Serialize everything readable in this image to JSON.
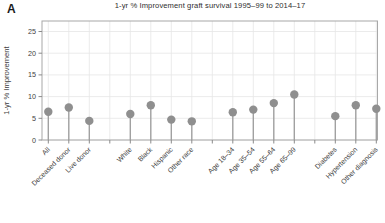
{
  "figure": {
    "panel_label": "A"
  },
  "chart_data": {
    "type": "lollipop",
    "title": "1-yr % Improvement graft survival 1995–99 to 2014–17",
    "xlabel": "",
    "ylabel": "1-yr % Improvement",
    "ylim": [
      0,
      27.4
    ],
    "yticks": [
      0,
      5,
      10,
      15,
      20,
      25
    ],
    "grid": "on",
    "legend": "none",
    "slots_total": 17,
    "series": [
      {
        "label": "All",
        "value": 6.5,
        "slot": 0
      },
      {
        "label": "Deceased donor",
        "value": 7.5,
        "slot": 1
      },
      {
        "label": "Live donor",
        "value": 4.4,
        "slot": 2
      },
      {
        "label": "White",
        "value": 6.0,
        "slot": 4
      },
      {
        "label": "Black",
        "value": 8.0,
        "slot": 5
      },
      {
        "label": "Hispanic",
        "value": 4.7,
        "slot": 6
      },
      {
        "label": "Other race",
        "value": 4.3,
        "slot": 7
      },
      {
        "label": "Age 18–34",
        "value": 6.4,
        "slot": 9
      },
      {
        "label": "Age 35–54",
        "value": 7.0,
        "slot": 10
      },
      {
        "label": "Age 55–64",
        "value": 8.5,
        "slot": 11
      },
      {
        "label": "Age 65–99",
        "value": 10.5,
        "slot": 12
      },
      {
        "label": "Diabetes",
        "value": 5.5,
        "slot": 14
      },
      {
        "label": "Hypertension",
        "value": 8.0,
        "slot": 15
      },
      {
        "label": "Other diagnosis",
        "value": 7.2,
        "slot": 16
      }
    ],
    "groups": [
      {
        "name": "donor",
        "categories": [
          "All",
          "Deceased donor",
          "Live donor"
        ]
      },
      {
        "name": "race",
        "categories": [
          "White",
          "Black",
          "Hispanic",
          "Other race"
        ]
      },
      {
        "name": "age",
        "categories": [
          "Age 18–34",
          "Age 35–54",
          "Age 55–64",
          "Age 65–99"
        ]
      },
      {
        "name": "diagnosis",
        "categories": [
          "Diabetes",
          "Hypertension",
          "Other diagnosis"
        ]
      }
    ],
    "colors": {
      "dot": "#8f8f8f",
      "stem": "#9c9c9c",
      "grid": "#e6e6e6",
      "border": "#a8a8a8",
      "tick": "#8a8a8a",
      "text": "#3d3d3d",
      "title": "#2e2e2e",
      "background": "#ffffff"
    }
  }
}
